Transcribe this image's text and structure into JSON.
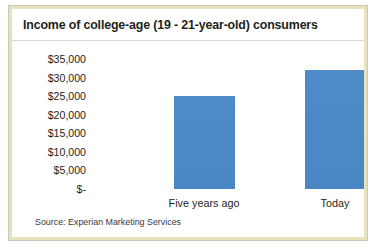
{
  "chart_data": {
    "type": "bar",
    "title": "Income of college-age (19 - 21-year-old) consumers",
    "categories": [
      "Five years ago",
      "Today"
    ],
    "values": [
      25000,
      32000
    ],
    "series": [
      {
        "name": "Income",
        "values": [
          25000,
          32000
        ],
        "color": "#4a86c8"
      }
    ],
    "xlabel": "",
    "ylabel": "",
    "ylim": [
      0,
      35000
    ],
    "ytick_values": [
      35000,
      30000,
      25000,
      20000,
      15000,
      10000,
      5000,
      0
    ],
    "ytick_labels": [
      "$35,000",
      "$30,000",
      "$25,000",
      "$20,000",
      "$15,000",
      "$10,000",
      "$5,000",
      "$-"
    ],
    "grid": false,
    "legend": "none",
    "source": "Source: Experian Marketing Services",
    "bar_color": "#4a86c8",
    "frame_color": "#e6e2bb",
    "text_color": "#231f20"
  }
}
